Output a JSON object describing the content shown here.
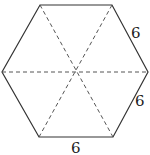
{
  "figure": {
    "shape": "regular-hexagon",
    "stroke_color": "#333333",
    "dash_color": "#555555",
    "vertices": [
      [
        40,
        5
      ],
      [
        112,
        5
      ],
      [
        148,
        72
      ],
      [
        113,
        137
      ],
      [
        39,
        137
      ],
      [
        2,
        72
      ]
    ],
    "center": [
      75,
      71
    ],
    "labels": [
      {
        "text": "6",
        "x": 136,
        "y": 38,
        "side": "top-right"
      },
      {
        "text": "6",
        "x": 140,
        "y": 106,
        "side": "bottom-right"
      },
      {
        "text": "6",
        "x": 76,
        "y": 153,
        "side": "bottom"
      }
    ],
    "diagonals": [
      {
        "from": [
          40,
          5
        ],
        "to": [
          113,
          137
        ]
      },
      {
        "from": [
          112,
          5
        ],
        "to": [
          39,
          137
        ]
      },
      {
        "from": [
          2,
          72
        ],
        "to": [
          148,
          72
        ]
      }
    ]
  }
}
